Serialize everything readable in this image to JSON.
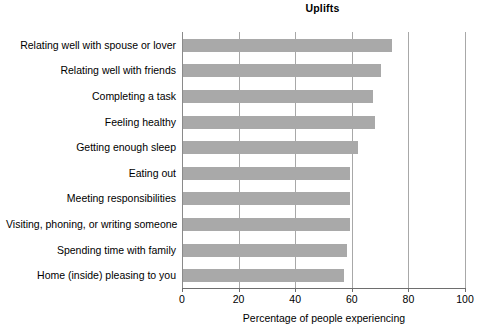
{
  "chart_data": {
    "type": "bar",
    "orientation": "horizontal",
    "title": "Uplifts",
    "xlabel": "Percentage of people experiencing",
    "ylabel": "",
    "xlim": [
      0,
      100
    ],
    "xticks": [
      0,
      20,
      40,
      60,
      80,
      100
    ],
    "xtick_labels": [
      "0",
      "20",
      "40",
      "60",
      "80",
      "100"
    ],
    "grid": "vertical",
    "legend": null,
    "bar_color": "#a9a9a9",
    "categories": [
      "Relating well with spouse or lover",
      "Relating well with friends",
      "Completing a task",
      "Feeling healthy",
      "Getting enough sleep",
      "Eating out",
      "Meeting responsibilities",
      "Visiting, phoning, or writing someone",
      "Spending time with family",
      "Home (inside) pleasing to you"
    ],
    "values": [
      74,
      70,
      67,
      68,
      62,
      59,
      59,
      59,
      58,
      57
    ]
  }
}
